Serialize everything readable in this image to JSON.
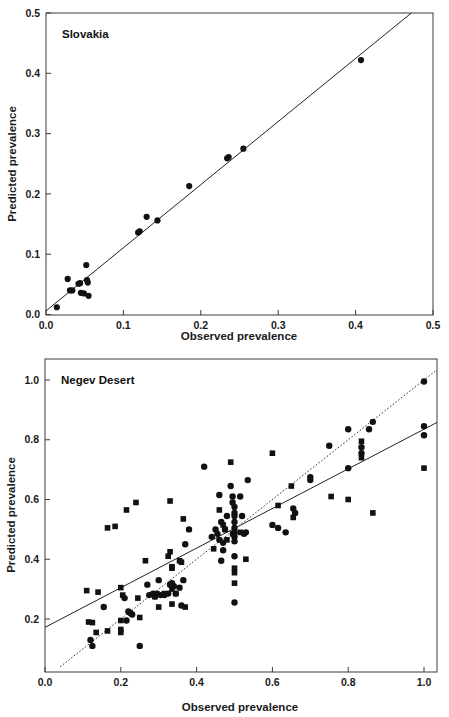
{
  "figure": {
    "background": "#ffffff",
    "marker_color": "#111111",
    "line_color": "#222222"
  },
  "chart_data": [
    {
      "type": "scatter",
      "panel_id": "top",
      "title": "Slovakia",
      "xlabel": "Observed prevalence",
      "ylabel": "Predicted prevalence",
      "xlim": [
        0.0,
        0.5
      ],
      "ylim": [
        0.0,
        0.5
      ],
      "xticks": [
        0.0,
        0.1,
        0.2,
        0.3,
        0.4,
        0.5
      ],
      "yticks": [
        0.0,
        0.1,
        0.2,
        0.3,
        0.4,
        0.5
      ],
      "xtick_labels": [
        "0.0",
        "0.1",
        "0.2",
        "0.3",
        "0.4",
        "0.5"
      ],
      "ytick_labels": [
        "0.0",
        "0.1",
        "0.2",
        "0.3",
        "0.4",
        "0.5"
      ],
      "grid": false,
      "legend": false,
      "series": [
        {
          "name": "Slovakia sites",
          "marker": "circle",
          "points": [
            [
              0.014,
              0.012
            ],
            [
              0.028,
              0.059
            ],
            [
              0.031,
              0.04
            ],
            [
              0.034,
              0.04
            ],
            [
              0.042,
              0.051
            ],
            [
              0.044,
              0.052
            ],
            [
              0.045,
              0.036
            ],
            [
              0.049,
              0.035
            ],
            [
              0.052,
              0.082
            ],
            [
              0.053,
              0.057
            ],
            [
              0.054,
              0.053
            ],
            [
              0.055,
              0.031
            ],
            [
              0.119,
              0.136
            ],
            [
              0.121,
              0.138
            ],
            [
              0.13,
              0.162
            ],
            [
              0.144,
              0.156
            ],
            [
              0.185,
              0.213
            ],
            [
              0.234,
              0.259
            ],
            [
              0.236,
              0.261
            ],
            [
              0.255,
              0.275
            ],
            [
              0.407,
              0.422
            ]
          ]
        }
      ],
      "lines": [
        {
          "name": "regression-line",
          "style": "solid",
          "from": [
            0.0,
            0.006
          ],
          "to": [
            0.472,
            0.5
          ]
        }
      ]
    },
    {
      "type": "scatter",
      "panel_id": "bottom",
      "title": "Negev Desert",
      "xlabel": "Observed prevalence",
      "ylabel": "Predicted prevalence",
      "xlim": [
        0.0,
        1.06
      ],
      "ylim": [
        0.04,
        1.06
      ],
      "xticks": [
        0.0,
        0.2,
        0.4,
        0.6,
        0.8,
        1.0
      ],
      "yticks": [
        0.2,
        0.4,
        0.6,
        0.8,
        1.0
      ],
      "xtick_labels": [
        "0.0",
        "0.2",
        "0.4",
        "0.6",
        "0.8",
        "1.0"
      ],
      "ytick_labels": [
        "0.2",
        "0.4",
        "0.6",
        "0.8",
        "1.0"
      ],
      "grid": false,
      "legend": false,
      "series": [
        {
          "name": "Negev circles",
          "marker": "circle",
          "points": [
            [
              0.12,
              0.13
            ],
            [
              0.125,
              0.11
            ],
            [
              0.155,
              0.24
            ],
            [
              0.21,
              0.27
            ],
            [
              0.215,
              0.195
            ],
            [
              0.22,
              0.225
            ],
            [
              0.225,
              0.22
            ],
            [
              0.23,
              0.215
            ],
            [
              0.25,
              0.11
            ],
            [
              0.27,
              0.315
            ],
            [
              0.275,
              0.28
            ],
            [
              0.285,
              0.285
            ],
            [
              0.29,
              0.275
            ],
            [
              0.3,
              0.33
            ],
            [
              0.305,
              0.28
            ],
            [
              0.315,
              0.28
            ],
            [
              0.325,
              0.285
            ],
            [
              0.33,
              0.315
            ],
            [
              0.335,
              0.32
            ],
            [
              0.34,
              0.31
            ],
            [
              0.345,
              0.285
            ],
            [
              0.355,
              0.305
            ],
            [
              0.36,
              0.245
            ],
            [
              0.365,
              0.33
            ],
            [
              0.37,
              0.45
            ],
            [
              0.38,
              0.5
            ],
            [
              0.42,
              0.71
            ],
            [
              0.44,
              0.475
            ],
            [
              0.45,
              0.5
            ],
            [
              0.455,
              0.485
            ],
            [
              0.46,
              0.465
            ],
            [
              0.46,
              0.615
            ],
            [
              0.465,
              0.525
            ],
            [
              0.465,
              0.395
            ],
            [
              0.47,
              0.455
            ],
            [
              0.47,
              0.43
            ],
            [
              0.475,
              0.5
            ],
            [
              0.48,
              0.545
            ],
            [
              0.49,
              0.645
            ],
            [
              0.495,
              0.61
            ],
            [
              0.495,
              0.59
            ],
            [
              0.5,
              0.575
            ],
            [
              0.5,
              0.555
            ],
            [
              0.5,
              0.545
            ],
            [
              0.5,
              0.525
            ],
            [
              0.5,
              0.505
            ],
            [
              0.5,
              0.49
            ],
            [
              0.5,
              0.475
            ],
            [
              0.5,
              0.46
            ],
            [
              0.5,
              0.41
            ],
            [
              0.5,
              0.255
            ],
            [
              0.515,
              0.61
            ],
            [
              0.52,
              0.545
            ],
            [
              0.525,
              0.485
            ],
            [
              0.53,
              0.49
            ],
            [
              0.535,
              0.665
            ],
            [
              0.6,
              0.515
            ],
            [
              0.615,
              0.505
            ],
            [
              0.635,
              0.49
            ],
            [
              0.655,
              0.57
            ],
            [
              0.66,
              0.555
            ],
            [
              0.7,
              0.675
            ],
            [
              0.7,
              0.665
            ],
            [
              0.75,
              0.78
            ],
            [
              0.8,
              0.835
            ],
            [
              0.8,
              0.705
            ],
            [
              0.835,
              0.775
            ],
            [
              0.835,
              0.755
            ],
            [
              0.855,
              0.835
            ],
            [
              0.865,
              0.86
            ],
            [
              1.0,
              0.995
            ],
            [
              1.0,
              0.845
            ],
            [
              1.0,
              0.815
            ]
          ]
        },
        {
          "name": "Negev squares",
          "marker": "square",
          "points": [
            [
              0.11,
              0.295
            ],
            [
              0.115,
              0.19
            ],
            [
              0.125,
              0.188
            ],
            [
              0.14,
              0.29
            ],
            [
              0.135,
              0.155
            ],
            [
              0.165,
              0.505
            ],
            [
              0.165,
              0.16
            ],
            [
              0.185,
              0.51
            ],
            [
              0.2,
              0.305
            ],
            [
              0.2,
              0.195
            ],
            [
              0.2,
              0.165
            ],
            [
              0.2,
              0.155
            ],
            [
              0.205,
              0.28
            ],
            [
              0.215,
              0.565
            ],
            [
              0.24,
              0.59
            ],
            [
              0.245,
              0.27
            ],
            [
              0.25,
              0.205
            ],
            [
              0.265,
              0.395
            ],
            [
              0.29,
              0.275
            ],
            [
              0.295,
              0.285
            ],
            [
              0.3,
              0.24
            ],
            [
              0.315,
              0.285
            ],
            [
              0.325,
              0.41
            ],
            [
              0.33,
              0.595
            ],
            [
              0.33,
              0.425
            ],
            [
              0.335,
              0.375
            ],
            [
              0.335,
              0.37
            ],
            [
              0.335,
              0.3
            ],
            [
              0.335,
              0.25
            ],
            [
              0.345,
              0.285
            ],
            [
              0.355,
              0.395
            ],
            [
              0.36,
              0.39
            ],
            [
              0.365,
              0.535
            ],
            [
              0.37,
              0.24
            ],
            [
              0.445,
              0.435
            ],
            [
              0.46,
              0.565
            ],
            [
              0.47,
              0.515
            ],
            [
              0.475,
              0.5
            ],
            [
              0.48,
              0.465
            ],
            [
              0.49,
              0.725
            ],
            [
              0.495,
              0.485
            ],
            [
              0.5,
              0.37
            ],
            [
              0.5,
              0.355
            ],
            [
              0.5,
              0.32
            ],
            [
              0.515,
              0.49
            ],
            [
              0.53,
              0.4
            ],
            [
              0.6,
              0.755
            ],
            [
              0.615,
              0.58
            ],
            [
              0.65,
              0.645
            ],
            [
              0.655,
              0.54
            ],
            [
              0.755,
              0.61
            ],
            [
              0.8,
              0.6
            ],
            [
              0.835,
              0.795
            ],
            [
              0.835,
              0.74
            ],
            [
              0.865,
              0.555
            ],
            [
              1.0,
              0.705
            ]
          ]
        }
      ],
      "lines": [
        {
          "name": "regression-line",
          "style": "solid",
          "from": [
            0.0,
            0.172
          ],
          "to": [
            1.06,
            0.875
          ]
        },
        {
          "name": "identity-line",
          "style": "dotted",
          "from": [
            0.04,
            0.04
          ],
          "to": [
            1.04,
            1.04
          ]
        }
      ]
    }
  ]
}
